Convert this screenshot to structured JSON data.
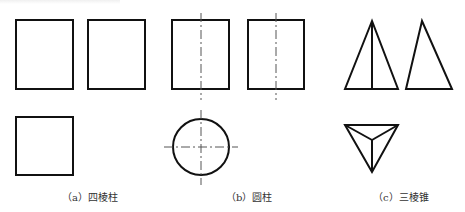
{
  "figure": {
    "panels": [
      {
        "id": "a",
        "caption": "（a）四棱柱",
        "subject": "square prism",
        "views": [
          "front-view-rectangle",
          "side-view-rectangle",
          "top-view-square"
        ]
      },
      {
        "id": "b",
        "caption": "（b）圆柱",
        "subject": "cylinder",
        "views": [
          "front-view-rectangle-with-centerline",
          "side-view-rectangle-with-centerline",
          "top-view-circle-with-crosshair"
        ]
      },
      {
        "id": "c",
        "caption": "（c）三棱锥",
        "subject": "triangular pyramid",
        "views": [
          "front-view-triangle-with-edge",
          "side-view-triangle",
          "top-view-triangle-with-center-edges"
        ]
      }
    ],
    "colors": {
      "outline": "#111111",
      "centerline": "#555555",
      "caption": "#333333",
      "background": "#ffffff"
    }
  }
}
